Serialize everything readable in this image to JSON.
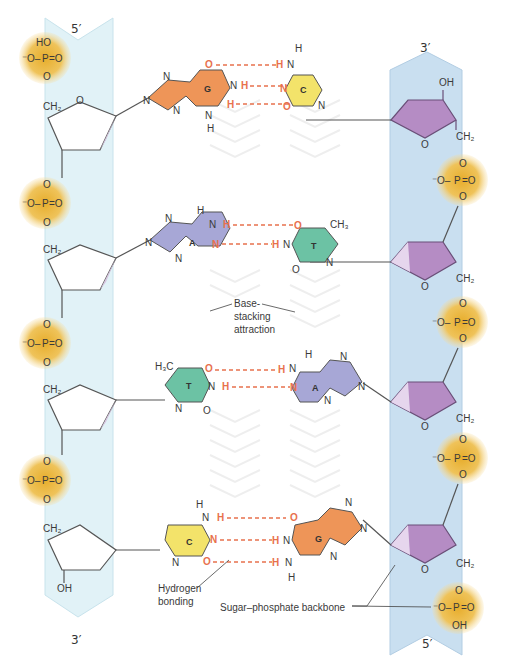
{
  "figure": {
    "title_partial": "",
    "colors": {
      "left_backbone": "#dff1f6",
      "right_backbone": "#c7def0",
      "phosphate": "#e9b63a",
      "sugar_right": "#b58cc4",
      "guanine": "#ee9558",
      "cytosine": "#f3e36a",
      "adenine": "#a7a7d6",
      "thymine": "#6cc2a4",
      "hbond": "#e8714d"
    },
    "left_strand": {
      "top_label": "5′",
      "bottom_label": "3′",
      "terminal_top": "HO",
      "terminal_bottom": "OH"
    },
    "right_strand": {
      "top_label": "3′",
      "bottom_label": "5′",
      "terminal_top": "OH",
      "terminal_bottom": "OH"
    },
    "phosphate": {
      "p": "P",
      "o": "O",
      "o_minus": "⁻O",
      "ch2": "CH₂"
    },
    "base_pairs": [
      {
        "left": "G",
        "right": "C",
        "hbonds": 3
      },
      {
        "left": "A",
        "right": "T",
        "hbonds": 2
      },
      {
        "left": "T",
        "right": "A",
        "hbonds": 2
      },
      {
        "left": "C",
        "right": "G",
        "hbonds": 3
      }
    ],
    "atoms": {
      "N": "N",
      "H": "H",
      "O": "O",
      "CH3": "CH₃",
      "H3C": "H₃C"
    },
    "annotations": {
      "base_stacking_line1": "Base-",
      "base_stacking_line2": "stacking",
      "base_stacking_line3": "attraction",
      "hydrogen_line1": "Hydrogen",
      "hydrogen_line2": "bonding",
      "backbone": "Sugar–phosphate backbone"
    }
  }
}
